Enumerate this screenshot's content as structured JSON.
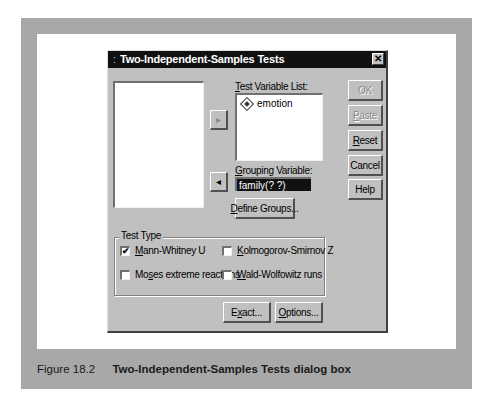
{
  "dialog": {
    "title": "Two-Independent-Samples Tests",
    "title_grip": ":",
    "close_glyph": "✕",
    "source_list": {
      "items": []
    },
    "move_to_test_arrow": "▸",
    "move_to_group_arrow": "◂",
    "test_variable_list": {
      "label_accel": "T",
      "label_rest": "est Variable List:",
      "items": [
        {
          "name": "emotion",
          "icon": "scale-variable-icon"
        }
      ]
    },
    "grouping_variable": {
      "label_accel": "G",
      "label_rest": "rouping Variable:",
      "value": "family(? ?)"
    },
    "define_groups": {
      "accel": "D",
      "rest": "efine Groups..."
    },
    "buttons": {
      "ok": "OK",
      "paste_accel": "P",
      "paste_rest": "aste",
      "reset_accel": "R",
      "reset_rest": "eset",
      "cancel": "Cancel",
      "help": "Help"
    },
    "test_type": {
      "label": "Test Type",
      "options": [
        {
          "accel": "M",
          "rest": "ann-Whitney U",
          "checked": true,
          "check_glyph": "✔"
        },
        {
          "accel": "K",
          "rest": "olmogorov-Smirnov Z",
          "checked": false
        },
        {
          "pre": "Mo",
          "accel": "s",
          "rest": "es extreme reactions",
          "checked": false
        },
        {
          "accel": "W",
          "rest": "ald-Wolfowitz runs",
          "checked": false
        }
      ]
    },
    "exact": {
      "pre": "E",
      "accel": "x",
      "rest": "act..."
    },
    "options": {
      "accel": "O",
      "rest": "ptions..."
    }
  },
  "caption": {
    "number": "Figure 18.2",
    "title": "Two-Independent-Samples Tests dialog box"
  }
}
